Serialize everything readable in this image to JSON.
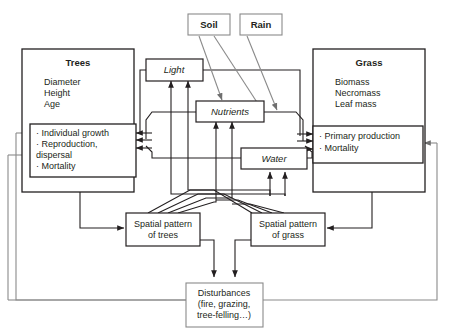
{
  "diagram": {
    "colors": {
      "line_dark": "#231f20",
      "line_grey": "#8a8a8a",
      "background": "#ffffff",
      "text": "#231f20"
    },
    "boxes": {
      "trees": {
        "title": "Trees",
        "attributes": [
          "Diameter",
          "Height",
          "Age"
        ],
        "processes": [
          "· Individual growth",
          "· Reproduction,",
          "   dispersal",
          "· Mortality"
        ]
      },
      "grass": {
        "title": "Grass",
        "attributes": [
          "Biomass",
          "Necromass",
          "Leaf mass"
        ],
        "processes": [
          "· Primary production",
          "· Mortality"
        ]
      },
      "soil": {
        "label": "Soil"
      },
      "rain": {
        "label": "Rain"
      },
      "light": {
        "label": "Light"
      },
      "nutrients": {
        "label": "Nutrients"
      },
      "water": {
        "label": "Water"
      },
      "spatial_trees": {
        "line1": "Spatial pattern",
        "line2": "of trees"
      },
      "spatial_grass": {
        "line1": "Spatial pattern",
        "line2": "of grass"
      },
      "disturbances": {
        "line1": "Disturbances",
        "line2": "(fire, grazing,",
        "line3": "tree-felling…)"
      }
    }
  }
}
